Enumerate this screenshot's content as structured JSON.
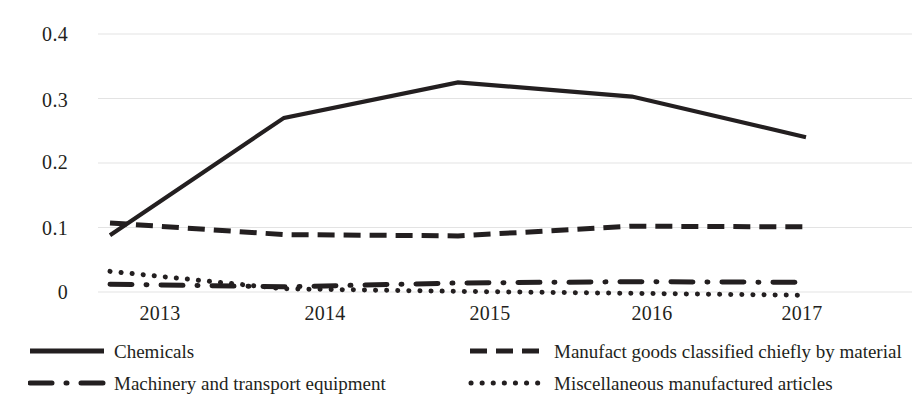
{
  "chart_data": {
    "type": "line",
    "title": "",
    "xlabel": "",
    "ylabel": "",
    "x": [
      "2013",
      "2014",
      "2015",
      "2016",
      "2017"
    ],
    "categories": [
      "2013",
      "2014",
      "2015",
      "2016",
      "2017"
    ],
    "ylim": [
      0.0,
      0.4
    ],
    "y_ticks": [
      "0",
      "0.1",
      "0.2",
      "0.3",
      "0.4"
    ],
    "y_tick_values": [
      0,
      0.1,
      0.2,
      0.3,
      0.4
    ],
    "grid": true,
    "grid_axis": "y",
    "legend_position": "bottom",
    "series": [
      {
        "name": "Chemicals",
        "style": "solid",
        "color": "#231f20",
        "values": [
          0.088,
          0.27,
          0.325,
          0.303,
          0.24
        ]
      },
      {
        "name": "Manufact goods classified chiefly by material",
        "style": "dashed",
        "color": "#231f20",
        "values": [
          0.107,
          0.089,
          0.087,
          0.102,
          0.101
        ]
      },
      {
        "name": "Machinery and transport equipment",
        "style": "dashdot",
        "color": "#231f20",
        "values": [
          0.012,
          0.008,
          0.014,
          0.016,
          0.015
        ]
      },
      {
        "name": "Miscellaneous manufactured articles",
        "style": "dotted",
        "color": "#231f20",
        "values": [
          0.032,
          0.005,
          0.001,
          -0.002,
          -0.005
        ]
      }
    ]
  },
  "axis": {
    "y_labels": [
      "0.4",
      "0.3",
      "0.2",
      "0.1",
      "0"
    ],
    "x_labels": [
      "2013",
      "2014",
      "2015",
      "2016",
      "2017"
    ]
  },
  "legend": {
    "items": [
      {
        "label": "Chemicals",
        "style": "solid"
      },
      {
        "label": "Manufact goods classified chiefly by material",
        "style": "dashed"
      },
      {
        "label": "Machinery and transport equipment",
        "style": "dashdot"
      },
      {
        "label": "Miscellaneous manufactured articles",
        "style": "dotted"
      }
    ]
  },
  "colors": {
    "ink": "#231f20",
    "gridline": "#e3e3e3",
    "background": "#ffffff"
  }
}
